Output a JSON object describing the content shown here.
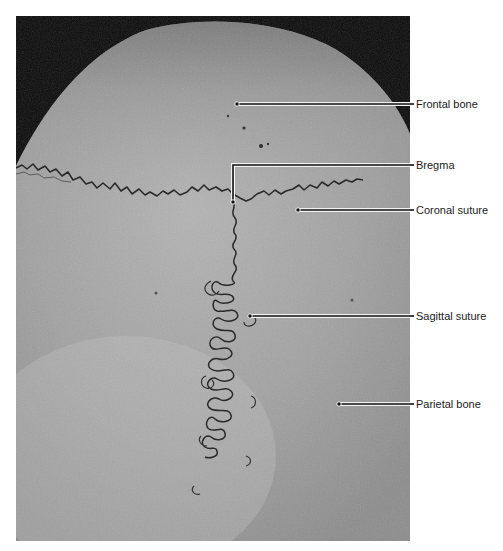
{
  "figure": {
    "colors": {
      "background": "#ffffff",
      "photo_dark": "#0a0a0a",
      "bone_light": "#b8b8b8",
      "bone_mid": "#9a9a9a",
      "suture": "#2a2a2a",
      "leader_line": "#111111",
      "leader_halo": "#f2f2f2",
      "label_text": "#1a1a1a"
    },
    "labels": [
      {
        "id": "frontal-bone",
        "text": "Frontal bone",
        "label_y": 104,
        "line_start_x": 237,
        "line_y": 104
      },
      {
        "id": "bregma",
        "text": "Bregma",
        "label_y": 165,
        "line_start_x": 233,
        "line_y": 165,
        "elbow_down_to_y": 202
      },
      {
        "id": "coronal-suture",
        "text": "Coronal suture",
        "label_y": 210,
        "line_start_x": 298,
        "line_y": 210
      },
      {
        "id": "sagittal-suture",
        "text": "Sagittal suture",
        "label_y": 316,
        "line_start_x": 250,
        "line_y": 316
      },
      {
        "id": "parietal-bone",
        "text": "Parietal bone",
        "label_y": 404,
        "line_start_x": 339,
        "line_y": 404
      }
    ]
  }
}
